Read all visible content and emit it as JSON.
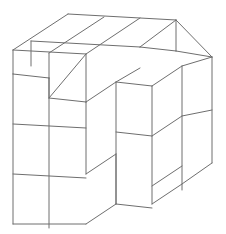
{
  "figure": {
    "type": "isometric-block-diagram",
    "background_color": "#ffffff",
    "line_color": "#6e6e6e",
    "face_color": "#ffffff",
    "line_width": 1,
    "canvas": {
      "width": 226,
      "height": 234
    },
    "projection": {
      "cell_width": 36.5,
      "cell_height": 50,
      "depth_x": 30,
      "depth_y": -20,
      "origin_x": 13,
      "origin_y": 224
    },
    "grid": {
      "columns": 3,
      "rows": 3,
      "layers": 3
    },
    "labels": [],
    "annotations": [],
    "polylines": [
      {
        "name": "front-left-outline",
        "points": "13,74 86,74 86,224 13,224 13,74"
      },
      {
        "name": "front-left-vertical-divider",
        "points": "49.5,74 49.5,224"
      },
      {
        "name": "front-left-horizontal-1",
        "points": "13,124 86,124"
      },
      {
        "name": "front-left-horizontal-2",
        "points": "13,174 86,174"
      },
      {
        "name": "front-step-top-right",
        "points": "86,74 116,54"
      },
      {
        "name": "front-step-edge-a",
        "points": "116,54 116,104"
      },
      {
        "name": "front-mid-face-top",
        "points": "116,104 152,104"
      },
      {
        "name": "front-mid-right",
        "points": "152,104 152,204"
      },
      {
        "name": "front-mid-h1",
        "points": "116,154 152,154"
      },
      {
        "name": "front-mid-left-vert",
        "points": "116,104 116,204"
      },
      {
        "name": "front-mid-bottom",
        "points": "116,204 152,204"
      },
      {
        "name": "front-protrusion-top-left",
        "points": "86,174 116,154"
      },
      {
        "name": "front-protrusion-top-right",
        "points": "116,154 116,204"
      },
      {
        "name": "front-protrusion-bottom",
        "points": "86,224 116,204"
      },
      {
        "name": "right-face-outline",
        "points": "152,104 182,84 182,184 152,204"
      },
      {
        "name": "right-upper-block",
        "points": "152,54 182,34"
      },
      {
        "name": "top-back-left",
        "points": "13,74 43,54"
      },
      {
        "name": "top-left-ridge",
        "points": "43,54 43,104"
      }
    ]
  }
}
